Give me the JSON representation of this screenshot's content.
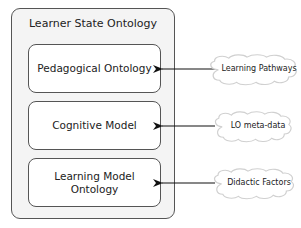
{
  "diagram": {
    "container": {
      "title": "Learner State Ontology"
    },
    "boxes": [
      {
        "label": "Pedagogical Ontology"
      },
      {
        "label": "Cognitive Model"
      },
      {
        "label": "Learning Model Ontology"
      }
    ],
    "sources": [
      {
        "label": "Learning Pathways",
        "target": "Pedagogical Ontology"
      },
      {
        "label": "LO meta-data",
        "target": "Cognitive Model"
      },
      {
        "label": "Didactic Factors",
        "target": "Learning Model Ontology"
      }
    ],
    "colors": {
      "border": "#555555",
      "container_fill": "#f4f4f4",
      "box_fill": "#ffffff",
      "arrow": "#111111"
    }
  }
}
